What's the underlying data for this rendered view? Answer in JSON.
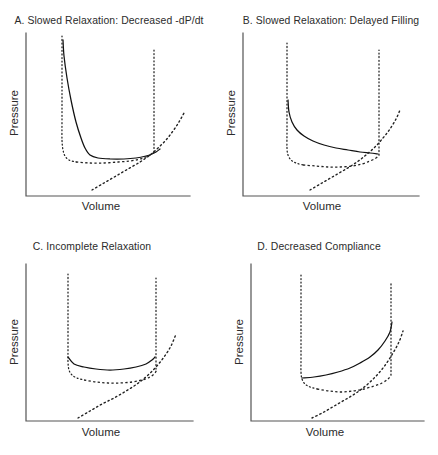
{
  "figure": {
    "background_color": "#ffffff",
    "line_color": "#111111",
    "axis_color": "#545454",
    "width": 438,
    "height": 455
  },
  "panels": [
    {
      "id": "A",
      "label": "A. Slowed Relaxation: Decreased -dP/dt",
      "xlabel": "Volume",
      "ylabel": "Pressure"
    },
    {
      "id": "B",
      "label": "B. Slowed Relaxation: Delayed Filling",
      "xlabel": "Volume",
      "ylabel": "Pressure"
    },
    {
      "id": "C",
      "label": "C. Incomplete Relaxation",
      "xlabel": "Volume",
      "ylabel": "Pressure"
    },
    {
      "id": "D",
      "label": "D. Decreased Compliance",
      "xlabel": "Volume",
      "ylabel": "Pressure"
    }
  ],
  "chart_data": [
    {
      "type": "line",
      "panel": "A",
      "title": "A. Slowed Relaxation: Decreased -dP/dt",
      "xlabel": "Volume",
      "ylabel": "Pressure",
      "xlim": [
        0,
        219
      ],
      "ylim": [
        0,
        227
      ],
      "grid": false,
      "legend": "none",
      "annotations": [
        "Solid line = abnormal relaxation limb with slowed pressure decay",
        "Dotted loop = normal pressure-volume loop",
        "Dotted rising curve = end-diastolic pressure-volume relation (EDPVR)"
      ],
      "series": [
        {
          "name": "abnormal-relaxation-limb",
          "style": "solid",
          "points": [
            [
              63,
              40
            ],
            [
              64,
              56
            ],
            [
              67,
              78
            ],
            [
              71,
              100
            ],
            [
              76,
              122
            ],
            [
              81,
              138
            ],
            [
              85,
              148
            ],
            [
              90,
              155
            ],
            [
              98,
              158
            ],
            [
              110,
              159
            ],
            [
              124,
              159
            ],
            [
              136,
              158
            ],
            [
              146,
              156
            ],
            [
              152,
              154
            ],
            [
              156,
              152
            ],
            [
              160,
              149
            ]
          ]
        },
        {
          "name": "normal-loop-left-limb",
          "style": "dotted-fine",
          "points": [
            [
              62,
              36
            ],
            [
              62,
              60
            ],
            [
              62,
              90
            ],
            [
              62,
              120
            ],
            [
              62,
              140
            ],
            [
              63,
              150
            ],
            [
              65,
              156
            ],
            [
              69,
              160
            ],
            [
              76,
              162
            ]
          ]
        },
        {
          "name": "normal-loop-bottom",
          "style": "dashed",
          "points": [
            [
              76,
              162
            ],
            [
              90,
              163
            ],
            [
              104,
              163
            ],
            [
              118,
              162
            ],
            [
              130,
              161
            ],
            [
              140,
              159
            ],
            [
              148,
              156
            ],
            [
              152,
              154
            ],
            [
              154,
              152
            ]
          ]
        },
        {
          "name": "normal-loop-right-limb",
          "style": "dotted-fine",
          "points": [
            [
              154,
              152
            ],
            [
              154,
              130
            ],
            [
              154,
              105
            ],
            [
              154,
              80
            ],
            [
              154,
              60
            ],
            [
              154,
              48
            ]
          ]
        },
        {
          "name": "edpvr-curve",
          "style": "dotted-med",
          "points": [
            [
              92,
              190
            ],
            [
              104,
              183
            ],
            [
              116,
              176
            ],
            [
              128,
              169
            ],
            [
              140,
              162
            ],
            [
              150,
              155
            ],
            [
              158,
              148
            ],
            [
              166,
              140
            ],
            [
              173,
              131
            ],
            [
              179,
              122
            ],
            [
              184,
              113
            ]
          ]
        }
      ]
    },
    {
      "type": "line",
      "panel": "B",
      "title": "B. Slowed Relaxation: Delayed Filling",
      "xlabel": "Volume",
      "ylabel": "Pressure",
      "xlim": [
        0,
        219
      ],
      "ylim": [
        0,
        227
      ],
      "grid": false,
      "legend": "none",
      "annotations": [
        "Solid line = delayed filling limb held at elevated pressure",
        "Dashed/dotted loop = normal pressure-volume loop",
        "Dotted rising curve = end-diastolic pressure-volume relation (EDPVR)"
      ],
      "series": [
        {
          "name": "delayed-filling-limb",
          "style": "solid",
          "points": [
            [
              288,
              100
            ],
            [
              289,
              112
            ],
            [
              292,
              122
            ],
            [
              297,
              130
            ],
            [
              304,
              136
            ],
            [
              313,
              141
            ],
            [
              324,
              145
            ],
            [
              336,
              148
            ],
            [
              348,
              150
            ],
            [
              360,
              152
            ],
            [
              370,
              153
            ],
            [
              378,
              154
            ]
          ]
        },
        {
          "name": "normal-loop-left-limb",
          "style": "dotted-fine",
          "points": [
            [
              287,
              43
            ],
            [
              287,
              70
            ],
            [
              287,
              100
            ],
            [
              287,
              130
            ],
            [
              287,
              148
            ],
            [
              288,
              155
            ],
            [
              291,
              160
            ],
            [
              296,
              163
            ],
            [
              303,
              165
            ]
          ]
        },
        {
          "name": "normal-loop-bottom",
          "style": "dashed",
          "points": [
            [
              303,
              165
            ],
            [
              316,
              166
            ],
            [
              328,
              167
            ],
            [
              340,
              167
            ],
            [
              352,
              166
            ],
            [
              362,
              164
            ],
            [
              370,
              161
            ],
            [
              376,
              158
            ],
            [
              379,
              155
            ]
          ]
        },
        {
          "name": "normal-loop-right-limb",
          "style": "dotted-fine",
          "points": [
            [
              379,
              155
            ],
            [
              379,
              130
            ],
            [
              379,
              105
            ],
            [
              379,
              80
            ],
            [
              379,
              60
            ],
            [
              379,
              50
            ]
          ]
        },
        {
          "name": "edpvr-curve",
          "style": "dotted-med",
          "points": [
            [
              310,
              190
            ],
            [
              322,
              183
            ],
            [
              334,
              176
            ],
            [
              346,
              169
            ],
            [
              357,
              162
            ],
            [
              366,
              155
            ],
            [
              375,
              147
            ],
            [
              383,
              138
            ],
            [
              390,
              129
            ],
            [
              396,
              119
            ],
            [
              400,
              110
            ]
          ]
        }
      ]
    },
    {
      "type": "line",
      "panel": "C",
      "title": "C. Incomplete Relaxation",
      "xlabel": "Volume",
      "ylabel": "Pressure",
      "xlim": [
        0,
        219
      ],
      "ylim": [
        228,
        455
      ],
      "grid": false,
      "legend": "none",
      "annotations": [
        "Solid line = incomplete relaxation, whole diastolic limb shifted upward",
        "Dashed/dotted loop = normal pressure-volume loop",
        "Dotted rising curve = end-diastolic pressure-volume relation (EDPVR)"
      ],
      "series": [
        {
          "name": "incomplete-relaxation-limb",
          "style": "solid",
          "points": [
            [
              68,
              357
            ],
            [
              74,
              364
            ],
            [
              84,
              367
            ],
            [
              96,
              369
            ],
            [
              110,
              370
            ],
            [
              124,
              369
            ],
            [
              136,
              367
            ],
            [
              146,
              364
            ],
            [
              152,
              360
            ],
            [
              155,
              357
            ]
          ]
        },
        {
          "name": "normal-loop-left-limb",
          "style": "dotted-fine",
          "points": [
            [
              68,
              274
            ],
            [
              68,
              300
            ],
            [
              68,
              325
            ],
            [
              68,
              350
            ],
            [
              68,
              362
            ],
            [
              69,
              370
            ],
            [
              72,
              375
            ],
            [
              77,
              378
            ],
            [
              84,
              380
            ]
          ]
        },
        {
          "name": "normal-loop-bottom",
          "style": "dashed",
          "points": [
            [
              84,
              380
            ],
            [
              96,
              382
            ],
            [
              108,
              383
            ],
            [
              120,
              383
            ],
            [
              132,
              382
            ],
            [
              142,
              380
            ],
            [
              150,
              377
            ],
            [
              155,
              373
            ],
            [
              157,
              369
            ]
          ]
        },
        {
          "name": "normal-loop-right-limb",
          "style": "dotted-fine",
          "points": [
            [
              156,
              369
            ],
            [
              156,
              345
            ],
            [
              156,
              320
            ],
            [
              156,
              296
            ],
            [
              156,
              278
            ]
          ]
        },
        {
          "name": "edpvr-curve",
          "style": "dotted-med",
          "points": [
            [
              78,
              418
            ],
            [
              90,
              411
            ],
            [
              102,
              404
            ],
            [
              114,
              398
            ],
            [
              126,
              391
            ],
            [
              137,
              384
            ],
            [
              147,
              376
            ],
            [
              156,
              367
            ],
            [
              164,
              357
            ],
            [
              171,
              346
            ],
            [
              176,
              334
            ]
          ]
        }
      ]
    },
    {
      "type": "line",
      "panel": "D",
      "title": "D. Decreased Compliance",
      "xlabel": "Volume",
      "ylabel": "Pressure",
      "xlim": [
        219,
        438
      ],
      "ylim": [
        228,
        455
      ],
      "grid": false,
      "legend": "none",
      "annotations": [
        "Solid line = steep diastolic limb from decreased chamber compliance",
        "Dashed/dotted loop = normal pressure-volume loop",
        "Dotted rising curve = end-diastolic pressure-volume relation (EDPVR)"
      ],
      "series": [
        {
          "name": "decreased-compliance-limb",
          "style": "solid",
          "points": [
            [
              302,
              378
            ],
            [
              314,
              377
            ],
            [
              326,
              375
            ],
            [
              338,
              372
            ],
            [
              350,
              368
            ],
            [
              360,
              363
            ],
            [
              370,
              357
            ],
            [
              378,
              350
            ],
            [
              385,
              341
            ],
            [
              390,
              332
            ],
            [
              392,
              322
            ]
          ]
        },
        {
          "name": "normal-loop-left-limb",
          "style": "dotted-fine",
          "points": [
            [
              301,
              275
            ],
            [
              301,
              305
            ],
            [
              301,
              335
            ],
            [
              301,
              360
            ],
            [
              301,
              372
            ],
            [
              302,
              379
            ],
            [
              305,
              384
            ],
            [
              310,
              387
            ],
            [
              317,
              389
            ]
          ]
        },
        {
          "name": "normal-loop-bottom",
          "style": "dashed",
          "points": [
            [
              317,
              389
            ],
            [
              329,
              391
            ],
            [
              341,
              392
            ],
            [
              353,
              391
            ],
            [
              364,
              389
            ],
            [
              374,
              386
            ],
            [
              382,
              383
            ],
            [
              388,
              379
            ],
            [
              391,
              375
            ]
          ]
        },
        {
          "name": "normal-loop-right-limb",
          "style": "dotted-fine",
          "points": [
            [
              391,
              375
            ],
            [
              391,
              350
            ],
            [
              391,
              325
            ],
            [
              391,
              300
            ],
            [
              391,
              282
            ]
          ]
        },
        {
          "name": "edpvr-curve",
          "style": "dotted-med",
          "points": [
            [
              312,
              418
            ],
            [
              324,
              412
            ],
            [
              336,
              405
            ],
            [
              348,
              398
            ],
            [
              359,
              391
            ],
            [
              369,
              383
            ],
            [
              378,
              374
            ],
            [
              386,
              364
            ],
            [
              393,
              353
            ],
            [
              399,
              342
            ],
            [
              403,
              331
            ]
          ]
        }
      ]
    }
  ],
  "axes": {
    "A": {
      "x0": 26,
      "y0": 196,
      "x1": 190,
      "ytop": 33,
      "title_x": 109,
      "title_y": 14,
      "xlabel_x": 101,
      "xlabel_y": 210,
      "ylabel_x": 18,
      "ylabel_y": 113
    },
    "B": {
      "x0": 24,
      "y0": 196,
      "x1": 200,
      "ytop": 33,
      "title_x": 112,
      "title_y": 14,
      "xlabel_x": 103,
      "xlabel_y": 210,
      "ylabel_x": 16,
      "ylabel_y": 113
    },
    "C": {
      "x0": 26,
      "y0": 193,
      "x1": 193,
      "ytop": 36,
      "title_x": 92,
      "title_y": 12,
      "xlabel_x": 101,
      "xlabel_y": 208,
      "ylabel_x": 18,
      "ylabel_y": 114
    },
    "D": {
      "x0": 32,
      "y0": 193,
      "x1": 205,
      "ytop": 36,
      "title_x": 100,
      "title_y": 12,
      "xlabel_x": 106,
      "xlabel_y": 208,
      "ylabel_x": 24,
      "ylabel_y": 114
    }
  }
}
